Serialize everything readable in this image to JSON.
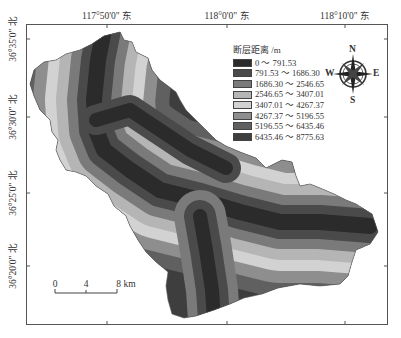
{
  "map": {
    "top_axis_labels": [
      {
        "label": "117°50'0\" 东",
        "x": 107
      },
      {
        "label": "118°0'0\" 东",
        "x": 227
      },
      {
        "label": "118°10'0\" 东",
        "x": 345
      }
    ],
    "left_axis_labels": [
      {
        "label": "36°35'0\" 北",
        "y": 39
      },
      {
        "label": "36°30'0\" 北",
        "y": 117
      },
      {
        "label": "36°25'0\" 北",
        "y": 193
      },
      {
        "label": "36°20'0\" 北",
        "y": 266
      }
    ],
    "legend": {
      "title": "断层距离 /m",
      "classes": [
        {
          "label": "0 ～ 791.53",
          "color": "#2b2b2b"
        },
        {
          "label": "791.53 ～ 1686.30",
          "color": "#4a4a4a"
        },
        {
          "label": "1686.30 ～ 2546.65",
          "color": "#7a7a7a"
        },
        {
          "label": "2546.65 ～ 3407.01",
          "color": "#b5b5b5"
        },
        {
          "label": "3407.01 ～ 4267.37",
          "color": "#d2d2d2"
        },
        {
          "label": "4267.37 ～ 5196.55",
          "color": "#8e8e8e"
        },
        {
          "label": "5196.55 ～ 6435.46",
          "color": "#606060"
        },
        {
          "label": "6435.46 ～ 8775.63",
          "color": "#3e3e3e"
        }
      ]
    },
    "compass": {
      "n": "N",
      "s": "S",
      "e": "E",
      "w": "W"
    },
    "scale_bar": {
      "ticks": [
        "0",
        "4",
        "8 km"
      ]
    }
  }
}
